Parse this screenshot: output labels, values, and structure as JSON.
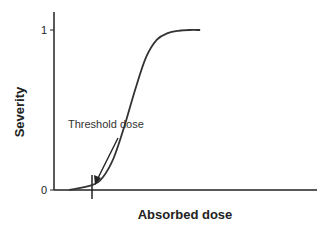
{
  "chart_data": {
    "type": "line",
    "title": "",
    "xlabel": "Absorbed dose",
    "ylabel": "Severity",
    "yticks": [
      "0",
      "1"
    ],
    "ylim": [
      0,
      1
    ],
    "xlim": [
      0,
      1
    ],
    "grid": false,
    "legend": "none",
    "series": [
      {
        "name": "Severity curve (sigmoid)",
        "x": [
          0.145,
          0.25,
          0.3,
          0.35,
          0.4,
          0.45,
          0.5,
          0.55,
          0.6,
          0.65,
          0.7,
          0.75
        ],
        "y": [
          0.0,
          0.03,
          0.08,
          0.2,
          0.4,
          0.63,
          0.83,
          0.94,
          0.98,
          0.995,
          1.0,
          1.0
        ]
      }
    ],
    "annotations": [
      {
        "text": "Threshold dose",
        "x": 0.145,
        "type": "arrow-to-tick"
      }
    ]
  }
}
